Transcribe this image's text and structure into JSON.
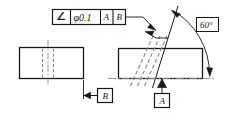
{
  "drawing": {
    "type": "engineering-drawing",
    "description": "GD&T angularity tolerance callout on two orthographic views of a rectangular block",
    "colors": {
      "line": "#1a1a1a",
      "hidden_line": "#8a8a8a",
      "center_line": "#8a8a8a",
      "background": "#ffffff"
    }
  },
  "feature_control_frame": {
    "name": "angularity-feature-control-frame",
    "cells": [
      {
        "key": "symbol",
        "text": "∠",
        "meaning": "angularity-symbol"
      },
      {
        "key": "tolerance",
        "text": "φ0.1",
        "meaning": "diameter-tolerance-zone"
      },
      {
        "key": "datum_primary",
        "text": "A",
        "meaning": "primary-datum"
      },
      {
        "key": "datum_secondary",
        "text": "B",
        "meaning": "secondary-datum"
      }
    ]
  },
  "dimensions": {
    "angle": {
      "name": "angle-dimension",
      "value": "60",
      "unit": "°",
      "text": "60°",
      "boxed": true
    }
  },
  "datums": [
    {
      "id": "B",
      "label": "B",
      "name": "datum-feature-b",
      "position": "left-view-right-side"
    },
    {
      "id": "A",
      "label": "A",
      "name": "datum-feature-a",
      "position": "right-view-bottom"
    }
  ],
  "views": [
    {
      "name": "left-view",
      "kind": "front-view",
      "features": [
        "hidden-lines-vertical",
        "center-line-vertical"
      ]
    },
    {
      "name": "right-view",
      "kind": "side-view",
      "features": [
        "hidden-lines-angled",
        "angled-feature-60-deg"
      ]
    }
  ]
}
